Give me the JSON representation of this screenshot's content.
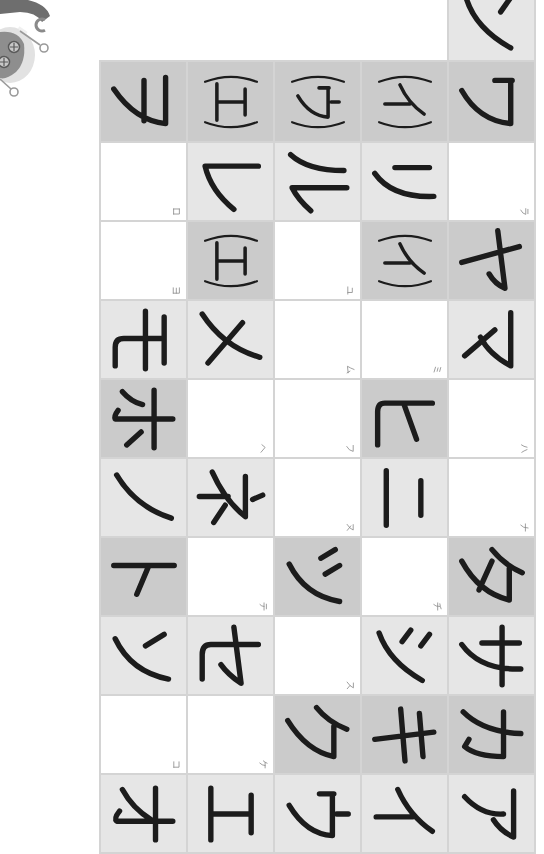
{
  "colors": {
    "page_background": "#ffffff",
    "grid_line": "#d4d4d4",
    "cell_dark": "#cbcbcb",
    "cell_light": "#e6e6e6",
    "cell_white": "#ffffff",
    "ink": "#1c1c1c",
    "hint_ink": "#8a8a8a"
  },
  "decoration": {
    "illustration": "robot-arm-illustration"
  },
  "table": {
    "top_cell": {
      "char": "ン",
      "kind": "main",
      "bg": "light"
    },
    "rows": [
      {
        "cells": [
          {
            "char": "ヲ",
            "kind": "main",
            "bg": "dark"
          },
          {
            "char": "(エ)",
            "kind": "paren",
            "bg": "dark"
          },
          {
            "char": "(ウ)",
            "kind": "paren",
            "bg": "dark"
          },
          {
            "char": "(イ)",
            "kind": "paren",
            "bg": "dark"
          },
          {
            "char": "ワ",
            "kind": "main",
            "bg": "dark"
          }
        ]
      },
      {
        "cells": [
          {
            "char": "ロ",
            "kind": "hint",
            "bg": "white"
          },
          {
            "char": "レ",
            "kind": "main",
            "bg": "light"
          },
          {
            "char": "ル",
            "kind": "main",
            "bg": "light"
          },
          {
            "char": "リ",
            "kind": "main",
            "bg": "light"
          },
          {
            "char": "ラ",
            "kind": "hint",
            "bg": "white"
          }
        ]
      },
      {
        "cells": [
          {
            "char": "ヨ",
            "kind": "hint",
            "bg": "white"
          },
          {
            "char": "(エ)",
            "kind": "paren",
            "bg": "dark"
          },
          {
            "char": "ユ",
            "kind": "hint",
            "bg": "white"
          },
          {
            "char": "(イ)",
            "kind": "paren",
            "bg": "dark"
          },
          {
            "char": "ヤ",
            "kind": "main",
            "bg": "dark"
          }
        ]
      },
      {
        "cells": [
          {
            "char": "モ",
            "kind": "main",
            "bg": "light"
          },
          {
            "char": "メ",
            "kind": "main",
            "bg": "light"
          },
          {
            "char": "ム",
            "kind": "hint",
            "bg": "white"
          },
          {
            "char": "ミ",
            "kind": "hint",
            "bg": "white"
          },
          {
            "char": "マ",
            "kind": "main",
            "bg": "light"
          }
        ]
      },
      {
        "cells": [
          {
            "char": "ホ",
            "kind": "main",
            "bg": "dark"
          },
          {
            "char": "ヘ",
            "kind": "hint",
            "bg": "white"
          },
          {
            "char": "フ",
            "kind": "hint",
            "bg": "white"
          },
          {
            "char": "ヒ",
            "kind": "main",
            "bg": "dark"
          },
          {
            "char": "ハ",
            "kind": "hint",
            "bg": "white"
          }
        ]
      },
      {
        "cells": [
          {
            "char": "ノ",
            "kind": "main",
            "bg": "light"
          },
          {
            "char": "ネ",
            "kind": "main",
            "bg": "light"
          },
          {
            "char": "ヌ",
            "kind": "hint",
            "bg": "white"
          },
          {
            "char": "ニ",
            "kind": "main",
            "bg": "light"
          },
          {
            "char": "ナ",
            "kind": "hint",
            "bg": "white"
          }
        ]
      },
      {
        "cells": [
          {
            "char": "ト",
            "kind": "main",
            "bg": "dark"
          },
          {
            "char": "テ",
            "kind": "hint",
            "bg": "white"
          },
          {
            "char": "ツ",
            "kind": "main",
            "bg": "dark"
          },
          {
            "char": "チ",
            "kind": "hint",
            "bg": "white"
          },
          {
            "char": "タ",
            "kind": "main",
            "bg": "dark"
          }
        ]
      },
      {
        "cells": [
          {
            "char": "ソ",
            "kind": "main",
            "bg": "light"
          },
          {
            "char": "セ",
            "kind": "main",
            "bg": "light"
          },
          {
            "char": "ス",
            "kind": "hint",
            "bg": "white"
          },
          {
            "char": "シ",
            "kind": "main",
            "bg": "light"
          },
          {
            "char": "サ",
            "kind": "main",
            "bg": "light"
          }
        ]
      },
      {
        "cells": [
          {
            "char": "コ",
            "kind": "hint",
            "bg": "white"
          },
          {
            "char": "ケ",
            "kind": "hint",
            "bg": "white"
          },
          {
            "char": "ク",
            "kind": "main",
            "bg": "dark"
          },
          {
            "char": "キ",
            "kind": "main",
            "bg": "dark"
          },
          {
            "char": "カ",
            "kind": "main",
            "bg": "dark"
          }
        ]
      },
      {
        "cells": [
          {
            "char": "オ",
            "kind": "main",
            "bg": "light"
          },
          {
            "char": "エ",
            "kind": "main",
            "bg": "light"
          },
          {
            "char": "ウ",
            "kind": "main",
            "bg": "light"
          },
          {
            "char": "イ",
            "kind": "main",
            "bg": "light"
          },
          {
            "char": "ア",
            "kind": "main",
            "bg": "light"
          }
        ]
      }
    ]
  }
}
